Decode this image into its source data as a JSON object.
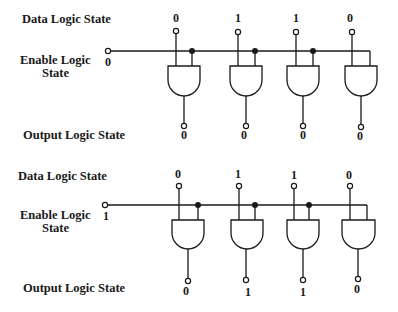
{
  "diagram": {
    "colors": {
      "ink": "#1a1a1a",
      "background": "#ffffff"
    },
    "circuits": [
      {
        "id": "top",
        "labels": {
          "data": "Data Logic State",
          "enable_line1": "Enable Logic",
          "enable_line2": "State",
          "output": "Output Logic State"
        },
        "enable_value": "0",
        "data_values": [
          "0",
          "1",
          "1",
          "0"
        ],
        "output_values": [
          "0",
          "0",
          "0",
          "0"
        ]
      },
      {
        "id": "bottom",
        "labels": {
          "data": "Data Logic State",
          "enable_line1": "Enable Logic",
          "enable_line2": "State",
          "output": "Output Logic State"
        },
        "enable_value": "1",
        "data_values": [
          "0",
          "1",
          "1",
          "0"
        ],
        "output_values": [
          "0",
          "1",
          "1",
          "0"
        ]
      }
    ]
  }
}
